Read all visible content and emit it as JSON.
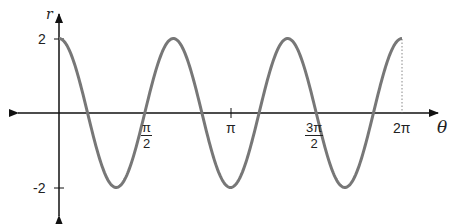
{
  "chart_data": {
    "type": "line",
    "title": "",
    "function": "r = 2cos(3θ)",
    "xlabel": "θ",
    "ylabel": "r",
    "xlim": [
      0,
      6.2832
    ],
    "ylim": [
      -2,
      2
    ],
    "x_ticks": [
      {
        "value": 1.5708,
        "label_num": "π",
        "label_den": "2"
      },
      {
        "value": 3.1416,
        "label": "π"
      },
      {
        "value": 4.7124,
        "label_num": "3π",
        "label_den": "2"
      },
      {
        "value": 6.2832,
        "label": "2π"
      }
    ],
    "y_ticks": [
      {
        "value": 2,
        "label": "2"
      },
      {
        "value": -2,
        "label": "-2"
      }
    ],
    "series": [
      {
        "name": "r = 2cos(3θ)",
        "color": "#777777",
        "x": [
          0,
          0.5236,
          1.0472,
          1.5708,
          2.0944,
          2.618,
          3.1416,
          3.6652,
          4.1888,
          4.7124,
          5.236,
          5.7596,
          6.2832
        ],
        "values": [
          2,
          0,
          -2,
          0,
          2,
          0,
          -2,
          0,
          2,
          0,
          -2,
          0,
          2
        ]
      }
    ],
    "grid": false,
    "legend": null,
    "annotations": [
      "dotted vertical line at θ = 2π from r = 2 to axis"
    ]
  },
  "axes": {
    "y_label": "r",
    "x_label": "θ",
    "tick_pi_half_num": "π",
    "tick_pi_half_den": "2",
    "tick_pi": "π",
    "tick_3pi_half_num": "3π",
    "tick_3pi_half_den": "2",
    "tick_2pi": "2π",
    "tick_y_pos": "2",
    "tick_y_neg": "-2"
  },
  "colors": {
    "curve": "#777777",
    "axis": "#111111"
  }
}
